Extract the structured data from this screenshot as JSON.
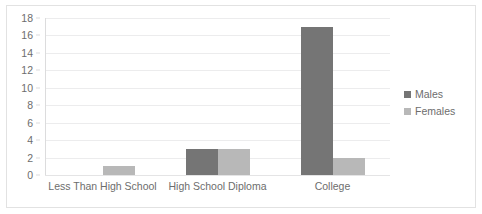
{
  "chart_data": {
    "type": "bar",
    "title": "",
    "xlabel": "",
    "ylabel": "",
    "categories": [
      "Less Than High School",
      "High School Diploma",
      "College"
    ],
    "series": [
      {
        "name": "Males",
        "color": "#757575",
        "values": [
          0,
          3,
          17
        ]
      },
      {
        "name": "Females",
        "color": "#b8b8b8",
        "values": [
          1,
          3,
          2
        ]
      }
    ],
    "ylim": [
      0,
      18
    ],
    "ytick_step": 2,
    "yticks": [
      0,
      2,
      4,
      6,
      8,
      10,
      12,
      14,
      16,
      18
    ],
    "ytick_labels": [
      "0",
      "2",
      "4",
      "6",
      "8",
      "10",
      "12",
      "14",
      "16",
      "18"
    ],
    "grid": true,
    "grid_axis": "y",
    "legend_position": "right",
    "legend_entries": [
      "Males",
      "Females"
    ],
    "background_color": "#ffffff",
    "grid_color": "#ececed",
    "text_color": "#6d6d6d",
    "border_color": "#e2e2e2"
  }
}
